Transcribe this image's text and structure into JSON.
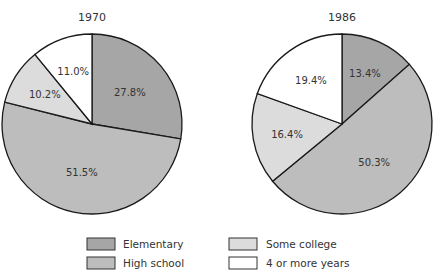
{
  "chart_data": [
    {
      "type": "pie",
      "title": "1970",
      "categories": [
        "Elementary",
        "High school",
        "Some college",
        "4 or more years"
      ],
      "values": [
        27.8,
        51.5,
        10.2,
        11.0
      ],
      "labels": [
        "27.8%",
        "51.5%",
        "10.2%",
        "11.0%"
      ]
    },
    {
      "type": "pie",
      "title": "1986",
      "categories": [
        "Elementary",
        "High school",
        "Some college",
        "4 or more years"
      ],
      "values": [
        13.4,
        50.3,
        16.4,
        19.4
      ],
      "labels": [
        "13.4%",
        "50.3%",
        "16.4%",
        "19.4%"
      ]
    }
  ],
  "legend": {
    "position": "bottom",
    "items": [
      {
        "label": "Elementary",
        "color": "#a6a6a6"
      },
      {
        "label": "High school",
        "color": "#bdbdbd"
      },
      {
        "label": "Some college",
        "color": "#dcdcdc"
      },
      {
        "label": "4 or more years",
        "color": "#ffffff"
      }
    ]
  },
  "colors": {
    "Elementary": "#a6a6a6",
    "High school": "#bdbdbd",
    "Some college": "#dcdcdc",
    "4 or more years": "#ffffff",
    "stroke": "#1a1a1a"
  }
}
